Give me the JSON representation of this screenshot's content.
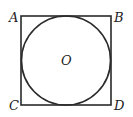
{
  "diagram": {
    "square": {
      "x": 21,
      "y": 16,
      "width": 90,
      "height": 89,
      "stroke": "#2a2a2a"
    },
    "circle": {
      "cx": 66,
      "cy": 60.5,
      "r": 44.5,
      "stroke": "#2a2a2a"
    },
    "labels": {
      "A": "A",
      "B": "B",
      "C": "C",
      "D": "D",
      "O": "O"
    }
  }
}
